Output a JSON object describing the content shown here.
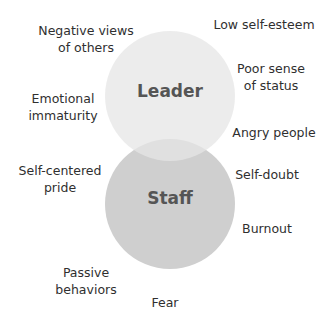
{
  "diagram": {
    "type": "venn",
    "circles": [
      {
        "id": "leader",
        "label": "Leader",
        "color": "#e6e6e6"
      },
      {
        "id": "staff",
        "label": "Staff",
        "color": "#cfcfcf"
      }
    ],
    "overlap_color": "#dadada",
    "terms": [
      {
        "id": "negative-views",
        "lines": [
          "Negative views",
          "of others"
        ]
      },
      {
        "id": "low-self-esteem",
        "lines": [
          "Low self-esteem"
        ]
      },
      {
        "id": "poor-sense-status",
        "lines": [
          "Poor sense",
          "of status"
        ]
      },
      {
        "id": "emotional-immaturity",
        "lines": [
          "Emotional",
          "immaturity"
        ]
      },
      {
        "id": "angry-people",
        "lines": [
          "Angry people"
        ]
      },
      {
        "id": "self-centered-pride",
        "lines": [
          "Self-centered",
          "pride"
        ]
      },
      {
        "id": "self-doubt",
        "lines": [
          "Self-doubt"
        ]
      },
      {
        "id": "burnout",
        "lines": [
          "Burnout"
        ]
      },
      {
        "id": "passive-behaviors",
        "lines": [
          "Passive",
          "behaviors"
        ]
      },
      {
        "id": "fear",
        "lines": [
          "Fear"
        ]
      }
    ]
  }
}
